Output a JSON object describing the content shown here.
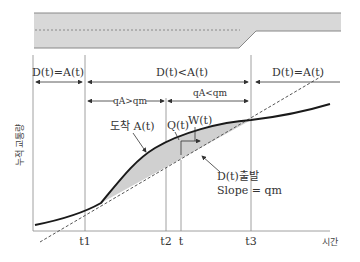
{
  "road": {
    "fill_color": "#d8d8d8",
    "edge_color": "#888888",
    "lane_divider_style": "dashed"
  },
  "regions": [
    {
      "label": "D(t)=A(t)"
    },
    {
      "label": "D(t)<A(t)"
    },
    {
      "label": "D(t)=A(t)"
    }
  ],
  "sub_regions": [
    {
      "label": "qA>qm"
    },
    {
      "label": "qA<qm"
    }
  ],
  "axes": {
    "y_label": "누적 교통량",
    "x_label": "시간",
    "x_ticks": [
      "t1",
      "t2",
      "t",
      "t3"
    ]
  },
  "annotations": {
    "arrival": "도착 A(t)",
    "queue": "Q(t)",
    "wait": "W(t)",
    "departure": "D(t)출발",
    "slope": "Slope = qm"
  },
  "colors": {
    "curve": "#1a1a1a",
    "dashed": "#555555",
    "shade": "#d0d0d0",
    "guide": "#888888"
  }
}
